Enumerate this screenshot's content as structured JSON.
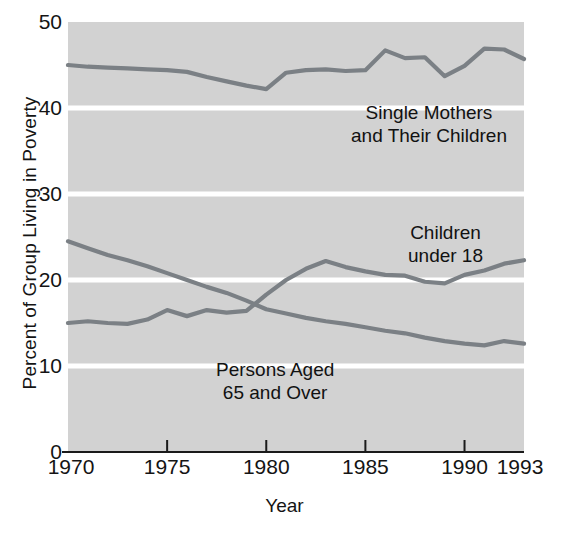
{
  "chart_data": {
    "type": "line",
    "title": "",
    "xlabel": "Year",
    "ylabel": "Percent of Group Living in Poverty",
    "xlim": [
      1970,
      1993
    ],
    "ylim": [
      0,
      50
    ],
    "xticks": [
      "1970",
      "1975",
      "1980",
      "1985",
      "1990",
      "1993"
    ],
    "xtick_values": [
      1970,
      1975,
      1980,
      1985,
      1990,
      1993
    ],
    "yticks": [
      "0",
      "10",
      "20",
      "30",
      "40",
      "50"
    ],
    "ytick_values": [
      0,
      10,
      20,
      30,
      40,
      50
    ],
    "grid": "horizontal-white-gridlines",
    "legend": "inline-annotations",
    "plot_background": "#d2d2d2",
    "gridline_color": "#ffffff",
    "line_color": "#7b8085",
    "x": [
      1970,
      1971,
      1972,
      1973,
      1974,
      1975,
      1976,
      1977,
      1978,
      1979,
      1980,
      1981,
      1982,
      1983,
      1984,
      1985,
      1986,
      1987,
      1988,
      1989,
      1990,
      1991,
      1992,
      1993
    ],
    "series": [
      {
        "name": "Single Mothers and Their Children",
        "values": [
          45.0,
          44.8,
          44.7,
          44.6,
          44.5,
          44.4,
          44.2,
          43.6,
          43.1,
          42.6,
          42.2,
          44.1,
          44.4,
          44.5,
          44.3,
          44.4,
          46.7,
          45.8,
          45.9,
          43.7,
          44.9,
          46.9,
          46.8,
          45.7
        ]
      },
      {
        "name": "Children under 18",
        "values": [
          24.5,
          23.7,
          22.9,
          22.3,
          21.6,
          20.8,
          20.0,
          19.2,
          18.5,
          17.6,
          16.6,
          16.1,
          15.6,
          15.2,
          14.9,
          14.5,
          14.1,
          13.8,
          13.3,
          12.9,
          12.6,
          12.4,
          12.9,
          12.6
        ]
      },
      {
        "name": "Persons Aged 65 and Over",
        "values": [
          15.0,
          15.2,
          15.0,
          14.9,
          15.4,
          16.5,
          15.8,
          16.5,
          16.2,
          16.4,
          18.3,
          20.0,
          21.3,
          22.2,
          21.5,
          21.0,
          20.6,
          20.5,
          19.8,
          19.6,
          20.6,
          21.1,
          21.9,
          22.3
        ]
      }
    ],
    "annotations": [
      {
        "text": "Single Mothers\nand Their Children",
        "x": 1985,
        "y": 36.5
      },
      {
        "text": "Children\nunder 18",
        "x": 1989,
        "y": 24.8
      },
      {
        "text": "Persons Aged\n65 and Over",
        "x": 1981,
        "y": 9.8
      }
    ]
  }
}
